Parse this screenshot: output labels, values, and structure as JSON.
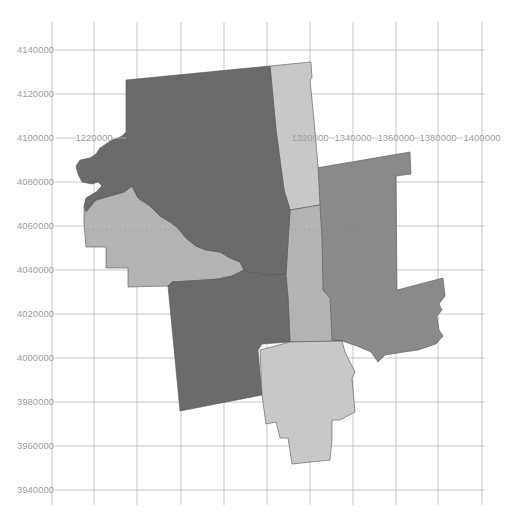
{
  "map": {
    "type": "choropleth-region-map",
    "projection_units": "meters (projected)",
    "y_axis": {
      "ticks": [
        {
          "label": "4140000",
          "y": 50
        },
        {
          "label": "4120000",
          "y": 94
        },
        {
          "label": "4100000",
          "y": 138
        },
        {
          "label": "4080000",
          "y": 182
        },
        {
          "label": "4060000",
          "y": 226
        },
        {
          "label": "4040000",
          "y": 270
        },
        {
          "label": "4020000",
          "y": 314
        },
        {
          "label": "4000000",
          "y": 358
        },
        {
          "label": "3980000",
          "y": 402
        },
        {
          "label": "3960000",
          "y": 446
        },
        {
          "label": "3940000",
          "y": 490
        }
      ]
    },
    "x_axis": {
      "visible_labels": [
        {
          "label": "1220000",
          "x": 94
        },
        {
          "label": "1320000",
          "x": 310
        },
        {
          "label": "1340000",
          "x": 353
        },
        {
          "label": "1360000",
          "x": 396
        },
        {
          "label": "1380000",
          "x": 438
        },
        {
          "label": "1400000",
          "x": 482
        }
      ],
      "gridline_x": [
        52,
        94,
        137,
        181,
        224,
        267,
        310,
        353,
        396,
        438,
        482
      ]
    },
    "colors": {
      "background": "#ffffff",
      "grid": "#b9b9b9",
      "label": "#a0a0a0",
      "region_dark": "#6b6b6b",
      "region_medium": "#8a8a8a",
      "region_light": "#b3b3b3",
      "region_lightest": "#c8c8c8",
      "region_border": "#555555"
    },
    "regions": [
      {
        "name": "northwest-region",
        "shade": "dark"
      },
      {
        "name": "north-central-strip",
        "shade": "lightest"
      },
      {
        "name": "west-lowland-region",
        "shade": "light"
      },
      {
        "name": "east-region",
        "shade": "medium"
      },
      {
        "name": "central-connector",
        "shade": "light"
      },
      {
        "name": "southwest-region",
        "shade": "dark"
      },
      {
        "name": "south-region",
        "shade": "lightest"
      }
    ]
  }
}
